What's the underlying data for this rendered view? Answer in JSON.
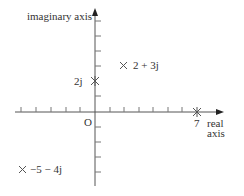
{
  "diagram": {
    "type": "argand-diagram",
    "axes": {
      "vertical_label": "imaginary axis",
      "horizontal_label_line1": "real",
      "horizontal_label_line2": "axis",
      "origin_label": "O"
    },
    "tick_labels": {
      "real_7": "7",
      "imag_2": "2j"
    },
    "points": [
      {
        "label": "2 + 3j",
        "re": 2,
        "im": 3
      },
      {
        "label": "−5 − 4j",
        "re": -5,
        "im": -4
      },
      {
        "label": "7",
        "re": 7,
        "im": 0
      },
      {
        "label": "2j",
        "re": 0,
        "im": 2
      }
    ],
    "colors": {
      "axis": "#555555",
      "text": "#333333",
      "background": "#ffffff"
    }
  }
}
